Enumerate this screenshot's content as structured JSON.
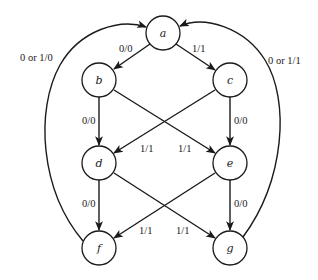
{
  "diagram": {
    "type": "state-transition-diagram",
    "node_radius": 17,
    "stroke_color": "#1a1a1a",
    "nodes": [
      {
        "id": "a",
        "label": "a",
        "x": 163,
        "y": 33
      },
      {
        "id": "b",
        "label": "b",
        "x": 99,
        "y": 80
      },
      {
        "id": "c",
        "label": "c",
        "x": 230,
        "y": 80
      },
      {
        "id": "d",
        "label": "d",
        "x": 99,
        "y": 163
      },
      {
        "id": "e",
        "label": "e",
        "x": 230,
        "y": 163
      },
      {
        "id": "f",
        "label": "f",
        "x": 99,
        "y": 248
      },
      {
        "id": "g",
        "label": "g",
        "x": 230,
        "y": 248
      }
    ],
    "edges": [
      {
        "from": "a",
        "to": "b",
        "label": "0/0"
      },
      {
        "from": "a",
        "to": "c",
        "label": "1/1"
      },
      {
        "from": "b",
        "to": "d",
        "label": "0/0"
      },
      {
        "from": "b",
        "to": "e",
        "label": "1/1"
      },
      {
        "from": "c",
        "to": "d",
        "label": "1/1"
      },
      {
        "from": "c",
        "to": "e",
        "label": "0/0"
      },
      {
        "from": "d",
        "to": "f",
        "label": "0/0"
      },
      {
        "from": "d",
        "to": "g",
        "label": "1/1"
      },
      {
        "from": "e",
        "to": "f",
        "label": "1/1"
      },
      {
        "from": "e",
        "to": "g",
        "label": "0/0"
      },
      {
        "from": "f",
        "to": "a",
        "label": "0 or 1/0"
      },
      {
        "from": "g",
        "to": "a",
        "label": "0 or 1/1"
      }
    ]
  }
}
